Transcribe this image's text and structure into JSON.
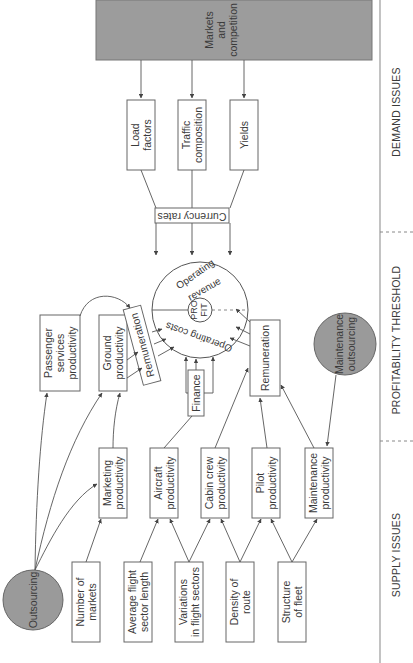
{
  "diagram": {
    "orientation": "rotated-90-ccw",
    "sections": {
      "demand": "DEMAND ISSUES",
      "threshold": "PROFITABILITY THRESHOLD",
      "supply": "SUPPLY ISSUES"
    },
    "center": {
      "top_label": "Operating revenue",
      "top_line1": "Operating",
      "top_line2": "revenue",
      "bottom_line1": "Operating costs",
      "core_line1": "PRO",
      "core_line2": "FIT"
    },
    "demand_nodes": {
      "markets": {
        "line1": "Markets",
        "line2": "and",
        "line3": "competition"
      },
      "load_factors": {
        "line1": "Load",
        "line2": "factors"
      },
      "traffic": {
        "line1": "Traffic",
        "line2": "composition"
      },
      "yields": {
        "line1": "Yields"
      },
      "currency": "Currency rates"
    },
    "threshold_nodes": {
      "passenger": {
        "line1": "Passenger",
        "line2": "services",
        "line3": "productivity"
      },
      "ground": {
        "line1": "Ground",
        "line2": "productivity"
      },
      "remuneration_upper": "Remuneration",
      "finance": "Finance",
      "remuneration_lower": "Remuneration",
      "maintenance_outsourcing": {
        "line1": "Maintenance",
        "line2": "outsourcing"
      }
    },
    "supply_nodes": {
      "outsourcing": "Outsourcing",
      "marketing": {
        "line1": "Marketing",
        "line2": "productivity"
      },
      "aircraft": {
        "line1": "Aircraft",
        "line2": "productivity"
      },
      "cabin": {
        "line1": "Cabin crew",
        "line2": "productivity"
      },
      "pilot": {
        "line1": "Pilot",
        "line2": "productivity"
      },
      "maintenance": {
        "line1": "Maintenance",
        "line2": "productivity"
      },
      "num_markets": {
        "line1": "Number of",
        "line2": "markets"
      },
      "avg_sector": {
        "line1": "Average flight",
        "line2": "sector length"
      },
      "variations": {
        "line1": "Variations",
        "line2": "in flight sectors"
      },
      "density": {
        "line1": "Density of",
        "line2": "route"
      },
      "fleet": {
        "line1": "Structure",
        "line2": "of fleet"
      }
    },
    "colors": {
      "box_stroke": "#666666",
      "gray_fill": "#9c9c9c",
      "separator": "#9a9a9a",
      "text": "#3a3a3a"
    }
  }
}
